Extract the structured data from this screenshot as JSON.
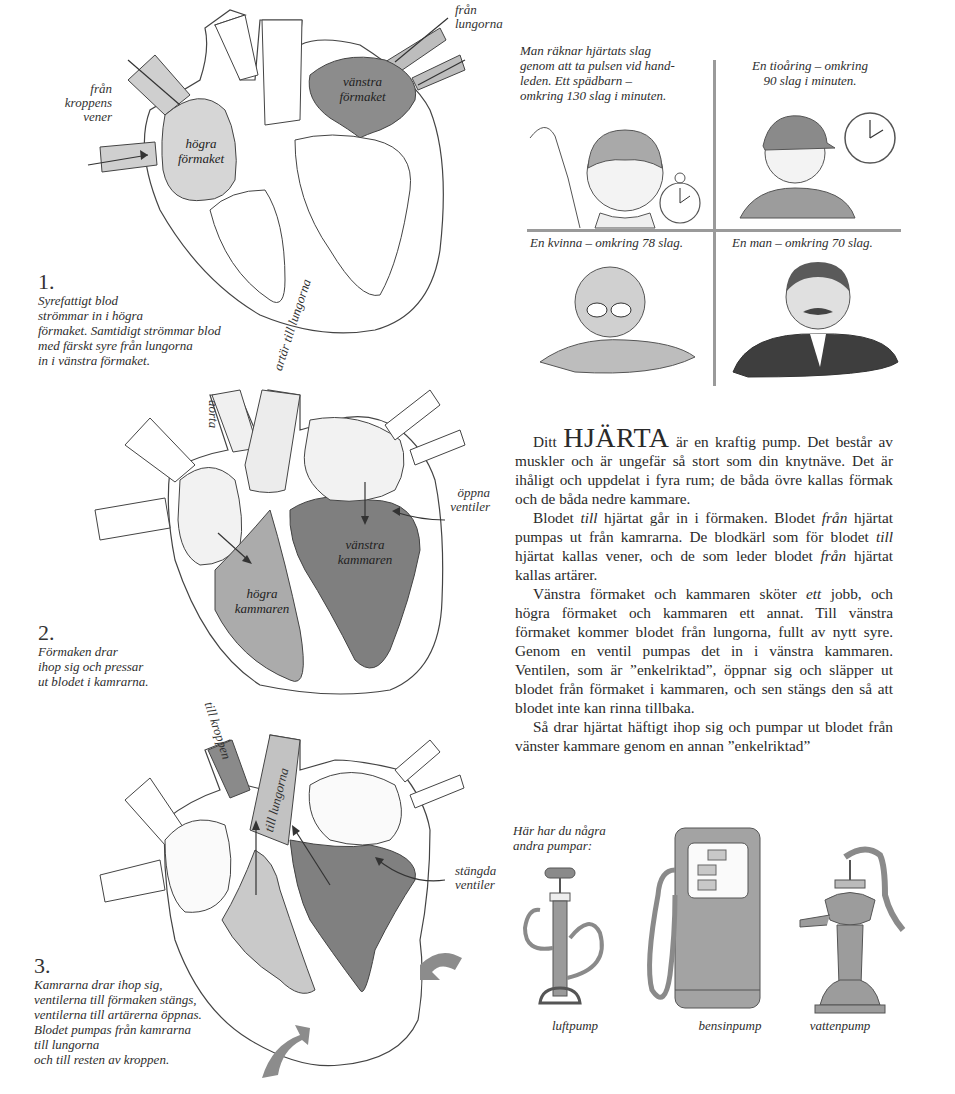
{
  "diagram1": {
    "number": "1.",
    "caption_lines": [
      "Syrefattigt blod",
      "strömmar in i högra",
      "förmaket. Samtidigt strömmar blod",
      "med färskt syre från lungorna",
      "in i vänstra förmaket."
    ],
    "label_veins_lines": [
      "från",
      "kroppens",
      "vener"
    ],
    "label_lungs_lines": [
      "från",
      "lungorna"
    ],
    "right_atrium_lines": [
      "högra",
      "förmaket"
    ],
    "left_atrium_lines": [
      "vänstra",
      "förmaket"
    ]
  },
  "diagram2": {
    "number": "2.",
    "caption_lines": [
      "Förmaken drar",
      "ihop sig och pressar",
      "ut blodet i kamrarna."
    ],
    "aorta_label": "aorta",
    "pulmonary_artery_label": "artär till lungorna",
    "open_valves_lines": [
      "öppna",
      "ventiler"
    ],
    "left_ventricle_lines": [
      "vänstra",
      "kammaren"
    ],
    "right_ventricle_lines": [
      "högra",
      "kammaren"
    ]
  },
  "diagram3": {
    "number": "3.",
    "caption_lines": [
      "Kamrarna drar ihop sig,",
      "ventilerna till förmaken stängs,",
      "ventilerna till artärerna öppnas.",
      "Blodet pumpas från kamrarna",
      "till lungorna",
      "och till resten av kroppen."
    ],
    "to_body_label": "till kroppen",
    "to_lungs_label": "till lungorna",
    "closed_valves_lines": [
      "stängda",
      "ventiler"
    ]
  },
  "pulse_panel": {
    "intro_lines": [
      "Man räknar hjärtats slag",
      "genom att ta pulsen vid hand-",
      "leden. Ett spädbarn –",
      "omkring 130 slag i minuten."
    ],
    "child_lines": [
      "En tioåring – omkring",
      "90 slag i minuten."
    ],
    "woman": "En kvinna – omkring 78 slag.",
    "man": "En man – omkring 70 slag."
  },
  "article": {
    "p1_lead": "Ditt",
    "p1_big": "HJÄRTA",
    "p1_rest": " är en kraftig pump. Det består av muskler och är ungefär så stort som din knytnäve. Det är ihåligt och uppdelat i fyra rum; de båda övre kallas förmak och de båda nedre kammare.",
    "p2_a": "Blodet ",
    "p2_till1": "till",
    "p2_b": " hjärtat går in i förmaken. Blodet ",
    "p2_fran1": "från",
    "p2_c": " hjärtat pumpas ut från kamrarna. De blodkärl som för blodet ",
    "p2_till2": "till",
    "p2_d": " hjärtat kallas vener, och de som leder blodet ",
    "p2_fran2": "från",
    "p2_e": " hjärtat kallas artärer.",
    "p3_a": "Vänstra förmaket och kammaren sköter ",
    "p3_ett": "ett",
    "p3_b": " jobb, och högra förmaket och kammaren ett annat. Till vänstra förmaket kommer blodet från lungorna, fullt av nytt syre. Genom en ventil pumpas det in i vänstra kammaren. Ventilen, som är ”enkelriktad”, öppnar sig och släpper ut blodet från förmaket i kammaren, och sen stängs den så att blodet inte kan rinna tillbaka.",
    "p4": "Så drar hjärtat häftigt ihop sig och pumpar ut blodet från vänster kammare genom en annan ”enkelriktad”"
  },
  "pumps": {
    "title_lines": [
      "Här har du några",
      "andra pumpar:"
    ],
    "items": [
      {
        "label": "luftpump"
      },
      {
        "label": "bensinpump"
      },
      {
        "label": "vattenpump"
      }
    ]
  },
  "colors": {
    "ink": "#2a2a2a",
    "light_fill": "#d9d9d9",
    "mid_fill": "#a8a8a8",
    "dark_fill": "#7f7f7f",
    "divider": "#9a9a9a"
  }
}
